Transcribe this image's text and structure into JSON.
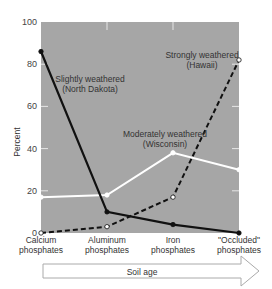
{
  "chart_data": {
    "type": "line",
    "title": "",
    "xlabel": "Soil age",
    "ylabel": "Percent",
    "ylim": [
      0,
      100
    ],
    "yticks": [
      0,
      20,
      40,
      60,
      80,
      100
    ],
    "grid": false,
    "categories": [
      "Calcium phosphates",
      "Aluminum phosphates",
      "Iron phosphates",
      "\"Occluded\" phosphates"
    ],
    "series": [
      {
        "name": "Slightly weathered (North Dakota)",
        "style": "solid-black",
        "values": [
          86,
          10,
          4,
          0
        ]
      },
      {
        "name": "Moderately weathered (Wisconsin)",
        "style": "solid-white",
        "values": [
          17,
          18,
          38,
          30
        ]
      },
      {
        "name": "Strongly weathered (Hawaii)",
        "style": "dashed-black",
        "values": [
          0,
          3,
          17,
          82
        ]
      }
    ],
    "annotations": [
      {
        "series": 0,
        "line1": "Slightly weathered",
        "line2": "(North Dakota)"
      },
      {
        "series": 1,
        "line1": "Moderately weathered",
        "line2": "(Wisconsin)"
      },
      {
        "series": 2,
        "line1": "Strongly weathered",
        "line2": "(Hawaii)"
      }
    ],
    "x_tick_labels": [
      {
        "line1": "Calcium",
        "line2": "phosphates"
      },
      {
        "line1": "Aluminum",
        "line2": "phosphates"
      },
      {
        "line1": "Iron",
        "line2": "phosphates"
      },
      {
        "line1": "\"Occluded\"",
        "line2": "phosphates"
      }
    ],
    "colors": {
      "plot_bg": "#a6a6a6",
      "series0": "#111111",
      "series1": "#ffffff",
      "series2": "#111111"
    }
  }
}
